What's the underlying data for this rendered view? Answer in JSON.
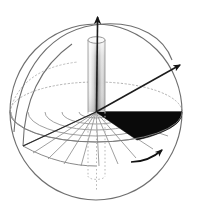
{
  "figure": {
    "title": "Sphere with polar coordinate grid, vertical axis cylinder and angular sector",
    "width": 198,
    "height": 213,
    "background_color": "#ffffff"
  },
  "colors": {
    "outline": "#6b6b6b",
    "outline_dark": "#4a4a4a",
    "grid": "#8c8c8c",
    "hidden_dash": "#a8a8a8",
    "sector_fill": "#0a0a0a",
    "axis": "#1a1a1a",
    "cylinder_light": "#f2f2f2",
    "cylinder_mid": "#c9c9c9",
    "cylinder_dark": "#7a7a7a"
  },
  "sphere": {
    "center_x": 96,
    "center_y": 112,
    "radius_x": 86,
    "radius_y": 88,
    "outline_label": "sphere-outline"
  },
  "equator": {
    "center_x": 96,
    "center_y": 112,
    "radius_x": 86,
    "radius_y": 30,
    "front_label": "equator-front-arc",
    "back_label": "equator-back-arc-hidden"
  },
  "axes": [
    {
      "name": "z-axis",
      "label": "vertical-polar-axis",
      "from_x": 96,
      "from_y": 112,
      "to_x": 98,
      "to_y": 12,
      "arrow": true
    },
    {
      "name": "r-axis",
      "label": "radial-direction-axis",
      "from_x": 96,
      "from_y": 112,
      "to_x": 186,
      "to_y": 62,
      "arrow": true
    },
    {
      "name": "x-axis",
      "label": "horizon-left-axis",
      "from_x": 96,
      "from_y": 112,
      "to_x": 23,
      "to_y": 146,
      "arrow": false
    }
  ],
  "cylinder": {
    "label": "vertical-gradient-cylinder",
    "top_y": 40,
    "bottom_y": 174,
    "left_x": 88,
    "right_x": 105,
    "cap_radius_x": 9,
    "cap_radius_y": 3.2,
    "hidden_below_equator": true
  },
  "sector": {
    "label": "angular-sector-wedge",
    "fill": "#0a0a0a",
    "apex_x": 96,
    "apex_y": 112,
    "start_angle_deg": 0,
    "end_angle_deg": 29,
    "description": "solid black azimuthal sector on equatorial plane"
  },
  "polar_grid": {
    "label": "equatorial-polar-grid",
    "radial_line_count": 9,
    "concentric_arc_count": 5,
    "stroke": "#8c8c8c"
  },
  "meridian": {
    "label": "left-meridian-arc",
    "stroke": "#6b6b6b"
  },
  "rotation_arrow": {
    "label": "azimuthal-rotation-arrow",
    "direction": "counter-clockwise-toward-upper-right",
    "stroke": "#111111"
  }
}
